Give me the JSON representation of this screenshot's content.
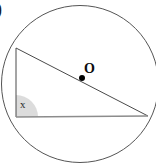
{
  "figure": {
    "background_color": "#ffffff",
    "stroke_color": "#555555",
    "triangle_stroke_color": "#4a4a4a",
    "base_stroke_color": "#8c8c8c",
    "angle_shade_color": "#d6d6d6",
    "center_dot_color": "#000000",
    "labels": {
      "option_marker": ")",
      "center": "O",
      "angle": "x"
    },
    "circle": {
      "center_x": 80,
      "center_y": 84,
      "radius": 79
    },
    "center_dot": {
      "x": 82,
      "y": 78,
      "radius": 3
    },
    "triangle": {
      "vertex_top_left": {
        "x": 16,
        "y": 48
      },
      "vertex_bottom_left": {
        "x": 16,
        "y": 117
      },
      "vertex_right": {
        "x": 148,
        "y": 116
      }
    },
    "angle_marker": {
      "vertex_x": 16,
      "vertex_y": 117,
      "radius": 22
    }
  }
}
